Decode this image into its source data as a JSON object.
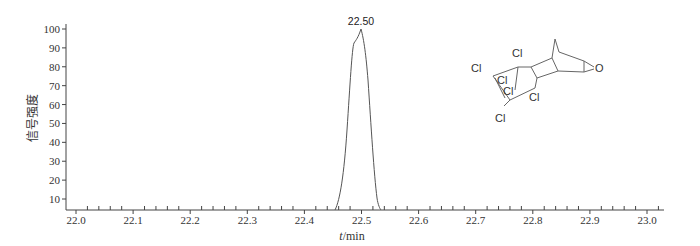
{
  "chart_data": {
    "type": "line",
    "title": "",
    "xlabel": "t/min",
    "ylabel": "信号强度",
    "xlim": [
      21.98,
      23.05
    ],
    "ylim": [
      5,
      100
    ],
    "x_ticks": [
      "22.0",
      "22.1",
      "22.2",
      "22.3",
      "22.4",
      "22.5",
      "22.6",
      "22.7",
      "22.8",
      "22.9",
      "23.0"
    ],
    "y_ticks": [
      "10",
      "20",
      "30",
      "40",
      "50",
      "60",
      "70",
      "80",
      "90",
      "100"
    ],
    "grid": false,
    "legend": null,
    "series": [
      {
        "name": "chromatogram",
        "x": [
          22.0,
          22.46,
          22.47,
          22.48,
          22.49,
          22.495,
          22.5,
          22.51,
          22.52,
          22.53,
          22.54,
          23.05
        ],
        "y": [
          3,
          3,
          20,
          55,
          95,
          97,
          100,
          80,
          45,
          15,
          3,
          3
        ]
      }
    ],
    "annotations": [
      {
        "text": "22.50",
        "x": 22.5,
        "y": 100,
        "type": "peak-label"
      },
      {
        "text": "chemical structure (polychlorinated epoxide, Cl×6, O)",
        "type": "structure-inset"
      }
    ]
  },
  "labels": {
    "peak": "22.50",
    "xlabel_italic": "t",
    "xlabel_unit": "/min",
    "ylabel": "信号强度",
    "cl": "Cl",
    "o": "O"
  }
}
